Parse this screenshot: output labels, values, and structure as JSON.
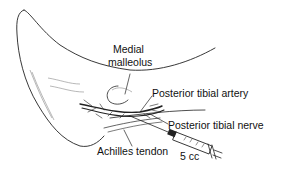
{
  "figure": {
    "labels": {
      "medial_malleolus_line1": "Medial",
      "medial_malleolus_line2": "malleolus",
      "posterior_tibial_artery": "Posterior tibial artery",
      "posterior_tibial_nerve": "Posterior tibial nerve",
      "achilles_tendon": "Achilles tendon",
      "syringe_volume": "5 cc"
    }
  }
}
